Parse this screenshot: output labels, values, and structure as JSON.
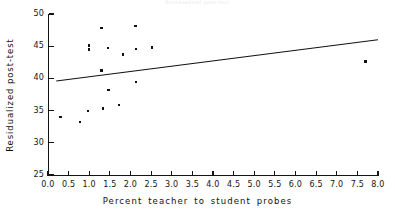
{
  "figure": {
    "header_faint_text": "Residualized post-test",
    "background_color": "#ffffff",
    "foreground_color": "#141414"
  },
  "chart_data": {
    "type": "scatter",
    "title": "",
    "xlabel": "Percent teacher to student probes",
    "ylabel": "Residualized post-test",
    "xlim": [
      0.0,
      8.0
    ],
    "ylim": [
      25,
      50
    ],
    "grid": false,
    "legend": null,
    "marker_color": "#111111",
    "marker_size_px": 2.4,
    "xticks": [
      "0.0",
      "0.5",
      "1.0",
      "1.5",
      "2.0",
      "2.5",
      "3.0",
      "3.5",
      "4.0",
      "4.5",
      "5.0",
      "5.5",
      "6.0",
      "6.5",
      "7.0",
      "7.5",
      "8.0"
    ],
    "xtick_values": [
      0.0,
      0.5,
      1.0,
      1.5,
      2.0,
      2.5,
      3.0,
      3.5,
      4.0,
      4.5,
      5.0,
      5.5,
      6.0,
      6.5,
      7.0,
      7.5,
      8.0
    ],
    "yticks": [
      "25",
      "30",
      "35",
      "40",
      "45",
      "50"
    ],
    "ytick_values": [
      25,
      30,
      35,
      40,
      45,
      50
    ],
    "points": [
      {
        "x": 0.3,
        "y": 34.0
      },
      {
        "x": 0.78,
        "y": 33.2
      },
      {
        "x": 0.97,
        "y": 34.9
      },
      {
        "x": 1.0,
        "y": 45.1
      },
      {
        "x": 1.0,
        "y": 44.5
      },
      {
        "x": 1.3,
        "y": 47.8
      },
      {
        "x": 1.3,
        "y": 41.2
      },
      {
        "x": 1.33,
        "y": 35.3
      },
      {
        "x": 1.45,
        "y": 44.7
      },
      {
        "x": 1.47,
        "y": 38.2
      },
      {
        "x": 1.72,
        "y": 35.9
      },
      {
        "x": 1.82,
        "y": 43.7
      },
      {
        "x": 2.12,
        "y": 48.1
      },
      {
        "x": 2.13,
        "y": 44.6
      },
      {
        "x": 2.14,
        "y": 39.4
      },
      {
        "x": 2.52,
        "y": 44.8
      },
      {
        "x": 7.7,
        "y": 42.6
      }
    ],
    "fit_line": {
      "label": "least-squares fit",
      "color": "#111111",
      "width_px": 1.1,
      "x_start": 0.2,
      "y_start": 39.6,
      "x_end": 8.0,
      "y_end": 46.0
    }
  }
}
